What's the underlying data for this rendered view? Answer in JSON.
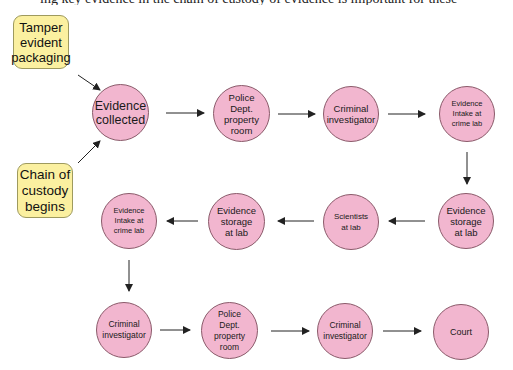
{
  "header": {
    "cut_text": "ing key evidence in the chain of custody of evidence is important for these"
  },
  "colors": {
    "node_fill": "#f2b6cf",
    "node_border": "#8a5a6a",
    "note_fill": "#fbf0a0",
    "note_border": "#9e9a5e",
    "arrow": "#222222"
  },
  "notes": [
    {
      "id": "tamper",
      "label": "Tamper\nevident\npackaging"
    },
    {
      "id": "chain",
      "label": "Chain of\ncustody\nbegins"
    }
  ],
  "nodes": [
    {
      "id": "n1",
      "label": "Evidence\ncollected"
    },
    {
      "id": "n2",
      "label": "Police\nDept.\nproperty\nroom"
    },
    {
      "id": "n3",
      "label": "Criminal\ninvestigator"
    },
    {
      "id": "n4",
      "label": "Evidence\nIntake at\ncrime lab"
    },
    {
      "id": "n5",
      "label": "Evidence\nstorage\nat lab"
    },
    {
      "id": "n6",
      "label": "Scientists\nat lab"
    },
    {
      "id": "n7",
      "label": "Evidence\nstorage\nat lab"
    },
    {
      "id": "n8",
      "label": "Evidence\nIntake at\ncrime lab"
    },
    {
      "id": "n9",
      "label": "Criminal\ninvestigator"
    },
    {
      "id": "n10",
      "label": "Police\nDept.\nproperty\nroom"
    },
    {
      "id": "n11",
      "label": "Criminal\ninvestigator"
    },
    {
      "id": "n12",
      "label": "Court"
    }
  ],
  "edges": [
    [
      "tamper",
      "n1"
    ],
    [
      "chain",
      "n1"
    ],
    [
      "n1",
      "n2"
    ],
    [
      "n2",
      "n3"
    ],
    [
      "n3",
      "n4"
    ],
    [
      "n4",
      "n5"
    ],
    [
      "n5",
      "n6"
    ],
    [
      "n6",
      "n7"
    ],
    [
      "n7",
      "n8"
    ],
    [
      "n8",
      "n9"
    ],
    [
      "n9",
      "n10"
    ],
    [
      "n10",
      "n11"
    ],
    [
      "n11",
      "n12"
    ]
  ]
}
